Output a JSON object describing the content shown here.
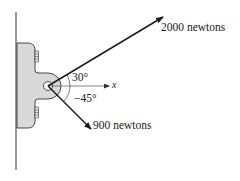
{
  "diagram": {
    "type": "force-vector-diagram",
    "colors": {
      "line": "#1a1a1a",
      "bracket_fill": "#d9d9d9",
      "bracket_stroke": "#333333",
      "axis": "#555555"
    },
    "forces": [
      {
        "id": "f1",
        "label": "2000 newtons",
        "magnitude": 2000,
        "unit": "newtons",
        "angle_deg": 30
      },
      {
        "id": "f2",
        "label": "900 newtons",
        "magnitude": 900,
        "unit": "newtons",
        "angle_deg": -45
      }
    ],
    "angles": {
      "upper": "30°",
      "lower": "−45°"
    },
    "axis": {
      "label": "x"
    }
  }
}
